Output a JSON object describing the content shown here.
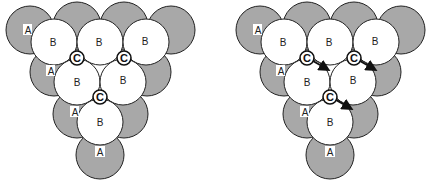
{
  "labels": {
    "a": "A",
    "b": "B",
    "c": "C"
  },
  "colors": {
    "a_fill": "#a8a8a8",
    "b_fill": "#ffffff",
    "stroke": "#222222"
  },
  "diagrams": [
    {
      "name": "left-packing",
      "arrows": false
    },
    {
      "name": "right-packing",
      "arrows": true
    }
  ]
}
